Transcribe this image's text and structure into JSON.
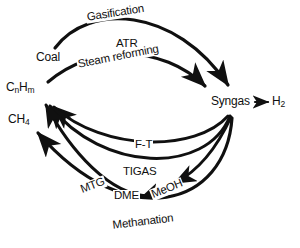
{
  "diagram": {
    "type": "process-flow-cycle",
    "background_color": "#ffffff",
    "stroke_color": "#101010",
    "nodes": [
      {
        "id": "coal",
        "label_html": "Coal",
        "text": "Coal",
        "x": 40,
        "y": 58
      },
      {
        "id": "cnhm",
        "label_html": "CnHm",
        "text": "CnHm",
        "x": 8,
        "y": 88
      },
      {
        "id": "ch4",
        "label_html": "CH4",
        "text": "CH4",
        "x": 10,
        "y": 120
      },
      {
        "id": "syngas",
        "label_html": "Syngas",
        "text": "Syngas",
        "x": 212,
        "y": 100
      },
      {
        "id": "h2",
        "label_html": "H2",
        "text": "H2",
        "x": 274,
        "y": 100
      }
    ],
    "node_text": {
      "coal": "Coal",
      "cnhm_base": "C",
      "cnhm_sub_n": "n",
      "cnhm_mid": "H",
      "cnhm_sub_m": "m",
      "ch4_base": "CH",
      "ch4_sub": "4",
      "syngas": "Syngas",
      "h2_base": "H",
      "h2_sub": "2"
    },
    "edges": [
      {
        "id": "gasification",
        "label": "Gasification",
        "from": "coal",
        "to": "syngas",
        "label_x": 85,
        "label_y": 16,
        "rotate": -9
      },
      {
        "id": "atr",
        "label": "ATR",
        "from": "cnhm",
        "to": "syngas",
        "label_x": 115,
        "label_y": 42,
        "rotate": 0
      },
      {
        "id": "steam-reforming",
        "label": "Steam reforming",
        "from": "cnhm",
        "to": "syngas",
        "label_x": 77,
        "label_y": 62,
        "rotate": -10
      },
      {
        "id": "ft",
        "label": "F-T",
        "from": "syngas",
        "to": "cnhm",
        "label_x": 134,
        "label_y": 141,
        "rotate": 0
      },
      {
        "id": "tigas",
        "label": "TIGAS",
        "from": "syngas",
        "to": "cnhm",
        "label_x": 123,
        "label_y": 168,
        "rotate": 0
      },
      {
        "id": "mtg",
        "label": "MTG",
        "from": "meoh",
        "to": "cnhm",
        "label_x": 78,
        "label_y": 187,
        "rotate": -20
      },
      {
        "id": "dme",
        "label": "DME",
        "from": "meoh",
        "to": "mtg",
        "label_x": 113,
        "label_y": 190,
        "rotate": 0
      },
      {
        "id": "meoh",
        "label": "MeOH",
        "from": "syngas",
        "to": "dme",
        "label_x": 148,
        "label_y": 188,
        "rotate": -20
      },
      {
        "id": "methanation",
        "label": "Methanation",
        "from": "syngas",
        "to": "ch4",
        "label_x": 112,
        "label_y": 222,
        "rotate": -7
      }
    ],
    "h2_arrow_glyph": "→"
  }
}
